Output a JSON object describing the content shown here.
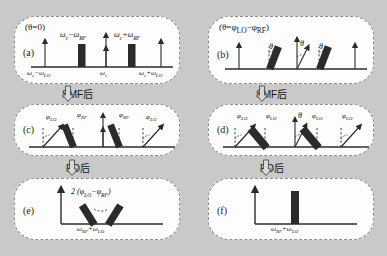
{
  "figure": {
    "background_color": "#c9c9c9",
    "panel_color": "#fdfdfd",
    "bar_color": "#2b2b2b",
    "axis_color": "#2b2b2b"
  },
  "flow_arrows": [
    {
      "id": "smf-left",
      "label": "SMF后",
      "glyph": "⇩"
    },
    {
      "id": "smf-right",
      "label": "SMF后",
      "glyph": "⇩"
    },
    {
      "id": "pd-left",
      "label": "PD后",
      "glyph": "⇩"
    },
    {
      "id": "pd-right",
      "label": "PD后",
      "glyph": "⇩"
    }
  ],
  "panels": {
    "a": {
      "tag": "(a)",
      "header": "(θ=0)",
      "axis_labels": [
        {
          "text": "ω",
          "sub": "c",
          "op": "−",
          "text2": "ω",
          "sub2": "LO",
          "full": "ωc−ωLO"
        },
        {
          "full": "ωc"
        },
        {
          "full": "ωc+ωLO"
        }
      ],
      "peak_labels": [
        {
          "full": "ωc−ωRF"
        },
        {
          "full": "ωc+ωRF"
        }
      ],
      "description": "four upright arrows plus two thick vertical bars, no tilt"
    },
    "b": {
      "tag": "(b)",
      "header": "(θ=φLO−φRF)",
      "angle_labels": [
        "θ",
        "θ",
        "θ"
      ],
      "description": "tilted thick bars with theta angle markers"
    },
    "c": {
      "tag": "(c)",
      "phase_labels": [
        {
          "full": "φLO"
        },
        {
          "full": "φRF"
        },
        {
          "full": "φRF"
        },
        {
          "full": "φLO"
        }
      ]
    },
    "d": {
      "tag": "(d)",
      "phase_labels": [
        {
          "full": "φLO"
        },
        {
          "full": "φLO"
        },
        {
          "full": "φLO"
        },
        {
          "full": "φLO"
        }
      ],
      "angle_labels": [
        "θ"
      ]
    },
    "e": {
      "tag": "(e)",
      "top_label": "2 (φLO−φRF)",
      "axis_label": "ωRF+ωLO"
    },
    "f": {
      "tag": "(f)",
      "axis_label": "ωRF+ωLO"
    }
  },
  "symbols": {
    "omega": "ω",
    "phi": "φ",
    "theta": "θ",
    "minus": "−",
    "plus": "+",
    "down_arrow": "⇩"
  }
}
